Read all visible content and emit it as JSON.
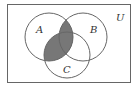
{
  "diagram": {
    "type": "venn",
    "universe_label": "U",
    "sets": [
      {
        "id": "A",
        "label": "A",
        "cx": 49,
        "cy": 37,
        "r": 24
      },
      {
        "id": "B",
        "label": "B",
        "cx": 83,
        "cy": 37,
        "r": 24
      },
      {
        "id": "C",
        "label": "C",
        "cx": 67,
        "cy": 55,
        "r": 23
      }
    ],
    "shaded_region": "A ∩ (B ∪ C)",
    "colors": {
      "shade": "#777777",
      "stroke": "#666666",
      "background": "#ffffff"
    }
  }
}
